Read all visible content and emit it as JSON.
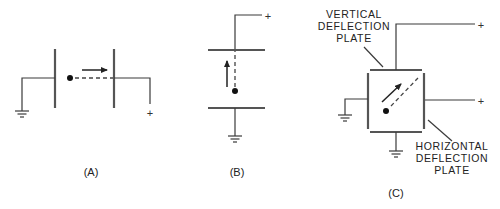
{
  "figure": {
    "panels": [
      {
        "id": "A",
        "caption": "(A)",
        "description": "Electron beam traveling horizontally between two vertical plates; left plate grounded, right plate positive",
        "terminals": {
          "left": "ground",
          "right": "+"
        },
        "beam_direction": "right"
      },
      {
        "id": "B",
        "caption": "(B)",
        "description": "Electron deflected upward between two horizontal plates; top plate positive, bottom plate grounded",
        "terminals": {
          "top": "+",
          "bottom": "ground"
        },
        "beam_direction": "up"
      },
      {
        "id": "C",
        "caption": "(C)",
        "description": "Four deflection plates arranged in a square; beam deflected diagonally",
        "terminals": {
          "top": "+",
          "right": "+",
          "left": "ground",
          "bottom": "ground"
        },
        "beam_direction": "up-right",
        "labels": {
          "vertical": [
            "VERTICAL",
            "DEFLECTION",
            "PLATE"
          ],
          "horizontal": [
            "HORIZONTAL",
            "DEFLECTION",
            "PLATE"
          ]
        }
      }
    ],
    "plus_sign": "+"
  },
  "colors": {
    "background": "#ffffff",
    "line": "#3a3a3a",
    "plate": "#555555",
    "text": "#222222"
  }
}
